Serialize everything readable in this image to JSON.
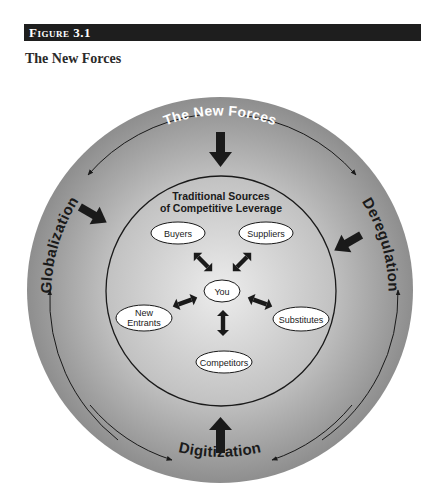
{
  "figure": {
    "label": "Figure 3.1",
    "title": "The New Forces"
  },
  "diagram": {
    "outer_ring": {
      "top_label": "The New Forces",
      "left_label": "Globalization",
      "right_label": "Deregulation",
      "bottom_label": "Digitization"
    },
    "inner_circle": {
      "title_line1": "Traditional Sources",
      "title_line2": "of Competitive Leverage"
    },
    "nodes": {
      "center": "You",
      "buyers": "Buyers",
      "suppliers": "Suppliers",
      "new_entrants_line1": "New",
      "new_entrants_line2": "Entrants",
      "substitutes": "Substitutes",
      "competitors": "Competitors"
    },
    "colors": {
      "header_bar": "#1e1e1e",
      "ring_dark": "#8c8c8c",
      "ring_light": "#d8d8d8",
      "ink": "#1a1a1a",
      "ellipse_fill": "#ffffff"
    }
  }
}
